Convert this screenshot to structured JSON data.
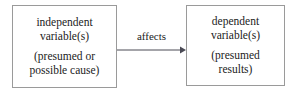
{
  "diagram": {
    "type": "flow-diagram",
    "background_color": "#ffffff",
    "border_color": "#9a9a9a",
    "text_color": "#1b1b1b",
    "nodes": [
      {
        "id": "independent",
        "primary": {
          "line1": "independent",
          "line2": "variable(s)"
        },
        "secondary": {
          "line1": "(presumed or",
          "line2": "possible cause)"
        }
      },
      {
        "id": "dependent",
        "primary": {
          "line1": "dependent",
          "line2": "variable(s)"
        },
        "secondary": {
          "line1": "(presumed",
          "line2": "results)"
        }
      }
    ],
    "connector": {
      "label": "affects",
      "direction": "left-to-right",
      "icon": "arrow-right-icon"
    }
  }
}
